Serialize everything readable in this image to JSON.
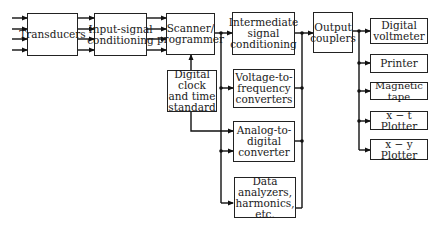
{
  "diagram": {
    "type": "block-diagram",
    "blocks": {
      "transducers": "Transducers",
      "input_signal_conditioning": "Input-signal conditioning",
      "scanner_programmer": "Scanner/ programmer",
      "digital_clock": "Digital clock and time standard",
      "intermediate_signal_conditioning": "Intermediate signal conditioning",
      "voltage_to_frequency": "Voltage-to- frequency converters",
      "analog_to_digital": "Analog-to- digital converter",
      "data_analyzers": "Data analyzers, harmonics, etc.",
      "output_couplers": "Output couplers",
      "digital_voltmeter": "Digital voltmeter",
      "printer": "Printer",
      "magnetic_tape": "Magnetic tape",
      "xt_plotter": "x − t Plotter",
      "xy_plotter": "x − y Plotter"
    },
    "connections": [
      [
        "inputs(4)",
        "transducers"
      ],
      [
        "transducers",
        "input_signal_conditioning"
      ],
      [
        "input_signal_conditioning",
        "scanner_programmer"
      ],
      [
        "digital_clock",
        "scanner_programmer"
      ],
      [
        "digital_clock",
        "analog_to_digital"
      ],
      [
        "scanner_programmer",
        "intermediate_signal_conditioning"
      ],
      [
        "scanner_programmer",
        "voltage_to_frequency"
      ],
      [
        "scanner_programmer",
        "analog_to_digital"
      ],
      [
        "scanner_programmer",
        "data_analyzers"
      ],
      [
        "intermediate_signal_conditioning",
        "output_couplers"
      ],
      [
        "voltage_to_frequency",
        "output_couplers"
      ],
      [
        "analog_to_digital",
        "output_couplers"
      ],
      [
        "data_analyzers",
        "output_couplers"
      ],
      [
        "output_couplers",
        "digital_voltmeter"
      ],
      [
        "output_couplers",
        "printer"
      ],
      [
        "output_couplers",
        "magnetic_tape"
      ],
      [
        "output_couplers",
        "xt_plotter"
      ],
      [
        "output_couplers",
        "xy_plotter"
      ]
    ]
  }
}
